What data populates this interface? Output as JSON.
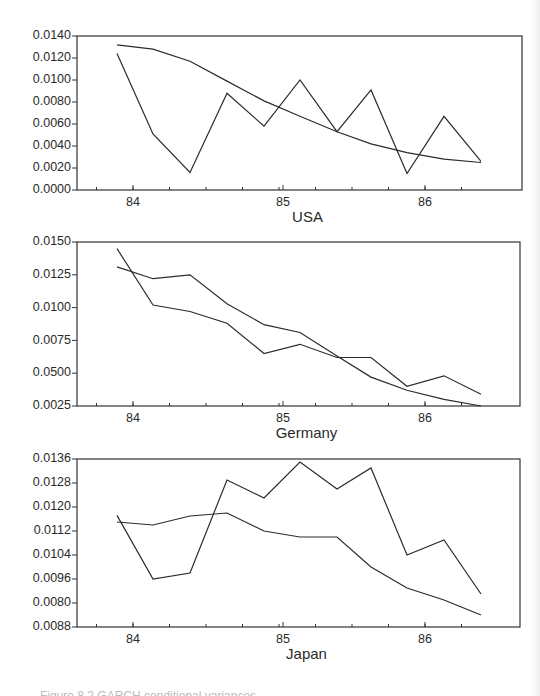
{
  "chart_data": [
    {
      "type": "line",
      "title": "USA",
      "xlabel": "USA",
      "ylabel": "",
      "x_tick_labels": [
        "84",
        "85",
        "86"
      ],
      "y_tick_labels": [
        "0.0140",
        "0.0120",
        "0.0100",
        "0.0080",
        "0.0060",
        "0.0040",
        "0.0020",
        "0.0000"
      ],
      "ylim": [
        0.0,
        0.014
      ],
      "grid": false,
      "legend": null,
      "x": [
        83.86,
        84.1,
        84.35,
        84.6,
        84.85,
        85.1,
        85.35,
        85.6,
        85.85,
        86.1,
        86.35
      ],
      "series": [
        {
          "name": "series_1",
          "values": [
            0.0124,
            0.0051,
            0.0016,
            0.0088,
            0.0058,
            0.01,
            0.0053,
            0.0091,
            0.0015,
            0.0067,
            0.0026
          ]
        },
        {
          "name": "series_2",
          "values": [
            0.0132,
            0.0128,
            0.0117,
            0.0099,
            0.0081,
            0.0067,
            0.0053,
            0.0042,
            0.0034,
            0.0028,
            0.0025
          ]
        }
      ]
    },
    {
      "type": "line",
      "title": "Germany",
      "xlabel": "Germany",
      "ylabel": "",
      "x_tick_labels": [
        "84",
        "85",
        "86"
      ],
      "y_tick_labels": [
        "0.0150",
        "0.0125",
        "0.0100",
        "0.0075",
        "0.0500",
        "0.0025"
      ],
      "ylim": [
        0.0025,
        0.015
      ],
      "grid": false,
      "legend": null,
      "x": [
        83.86,
        84.1,
        84.35,
        84.6,
        84.85,
        85.1,
        85.35,
        85.6,
        85.85,
        86.1,
        86.35
      ],
      "series": [
        {
          "name": "series_1",
          "values": [
            0.0145,
            0.0102,
            0.0097,
            0.0088,
            0.0065,
            0.0072,
            0.0062,
            0.0062,
            0.004,
            0.0048,
            0.0034
          ]
        },
        {
          "name": "series_2",
          "values": [
            0.0131,
            0.0122,
            0.0125,
            0.0103,
            0.0087,
            0.0081,
            0.0063,
            0.0047,
            0.0037,
            0.003,
            0.0025
          ]
        }
      ]
    },
    {
      "type": "line",
      "title": "Japan",
      "xlabel": "Japan",
      "ylabel": "",
      "x_tick_labels": [
        "84",
        "85",
        "86"
      ],
      "y_tick_labels": [
        "0.0136",
        "0.0128",
        "0.0120",
        "0.0112",
        "0.0104",
        "0.0096",
        "0.0080",
        "0.0088"
      ],
      "ylim": [
        0.008,
        0.0136
      ],
      "grid": false,
      "legend": null,
      "x": [
        83.86,
        84.1,
        84.35,
        84.6,
        84.85,
        85.1,
        85.35,
        85.6,
        85.85,
        86.1,
        86.35
      ],
      "series": [
        {
          "name": "series_1",
          "values": [
            0.01172,
            0.0096,
            0.0098,
            0.0129,
            0.0123,
            0.0135,
            0.0126,
            0.0133,
            0.0104,
            0.0109,
            0.0091
          ]
        },
        {
          "name": "series_2",
          "values": [
            0.0115,
            0.0114,
            0.0117,
            0.0118,
            0.0112,
            0.011,
            0.011,
            0.01,
            0.0093,
            0.0089,
            0.0084
          ]
        }
      ]
    }
  ],
  "panels": [
    {
      "title": "USA"
    },
    {
      "title": "Germany"
    },
    {
      "title": "Japan"
    }
  ],
  "caption": "Figure 8.2  GARCH conditional variances ..."
}
